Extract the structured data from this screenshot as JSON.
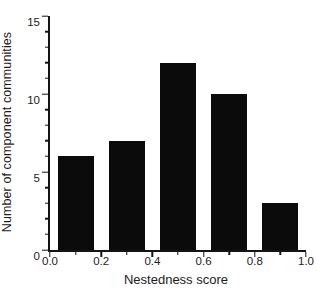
{
  "chart_data": {
    "type": "bar",
    "title": "",
    "xlabel": "Nestedness score",
    "ylabel": "Number of component communities",
    "categories": [
      "0.0-0.2",
      "0.2-0.4",
      "0.4-0.6",
      "0.6-0.8",
      "0.8-1.0"
    ],
    "values": [
      6,
      7,
      12,
      10,
      3
    ],
    "xlim": [
      0.0,
      1.0
    ],
    "ylim": [
      0,
      15
    ],
    "xticks_major": [
      0.0,
      0.2,
      0.4,
      0.6,
      0.8,
      1.0
    ],
    "xtick_labels": [
      "0.0",
      "0.2",
      "0.4",
      "0.6",
      "0.8",
      "1.0"
    ],
    "xtick_minor_step": 0.1,
    "yticks_major": [
      0,
      5,
      10,
      15
    ],
    "ytick_labels": [
      "0",
      "5",
      "10",
      "15"
    ],
    "ytick_minor_step": 1,
    "grid": false,
    "legend": null,
    "bar_color": "#0b0b0b",
    "axis_color": "#141414",
    "bar_width_fraction": 0.7
  }
}
